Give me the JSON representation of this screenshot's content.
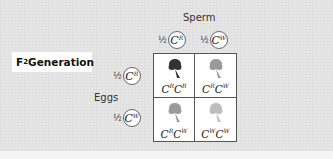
{
  "title": {
    "prefix": "F",
    "subscript": "2",
    "suffix": " Generation"
  },
  "sperm_label": "Sperm",
  "eggs_label": "Eggs",
  "sperm": [
    {
      "fraction": "½",
      "allele": "C",
      "superscript": "R"
    },
    {
      "fraction": "½",
      "allele": "C",
      "superscript": "W"
    }
  ],
  "eggs": [
    {
      "fraction": "½",
      "allele": "C",
      "superscript": "R"
    },
    {
      "fraction": "½",
      "allele": "C",
      "superscript": "W"
    }
  ],
  "cells": [
    {
      "row": 0,
      "col": 0,
      "a1": "C",
      "s1": "R",
      "a2": "C",
      "s2": "R",
      "phenotype": "red",
      "color": "#333333"
    },
    {
      "row": 0,
      "col": 1,
      "a1": "C",
      "s1": "R",
      "a2": "C",
      "s2": "W",
      "phenotype": "pink",
      "color": "#9a9a9a"
    },
    {
      "row": 1,
      "col": 0,
      "a1": "C",
      "s1": "R",
      "a2": "C",
      "s2": "W",
      "phenotype": "pink",
      "color": "#9a9a9a"
    },
    {
      "row": 1,
      "col": 1,
      "a1": "C",
      "s1": "W",
      "a2": "C",
      "s2": "W",
      "phenotype": "white",
      "color": "#bdbdbd"
    }
  ]
}
